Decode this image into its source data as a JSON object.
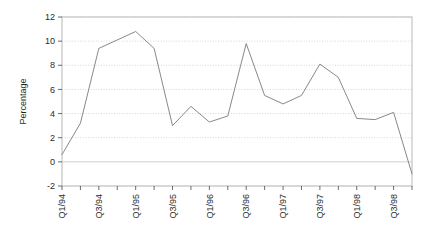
{
  "chart_data": {
    "type": "line",
    "title": "",
    "subtitle": "",
    "xlabel": "",
    "ylabel": "Percentage",
    "ylim": [
      -2,
      12
    ],
    "yticks": [
      -2,
      0,
      2,
      4,
      6,
      8,
      10,
      12
    ],
    "ytick_labels": [
      "-2",
      "0",
      "2",
      "4",
      "6",
      "8",
      "10",
      "12"
    ],
    "grid": true,
    "grid_style": "dotted-horizontal",
    "legend": "none",
    "line_color": "#7a7a7a",
    "frame_color": "#b8b8b8",
    "zero_line_color": "#d0d0d0",
    "background": "#ffffff",
    "x": [
      "Q1/94",
      "Q2/94",
      "Q3/94",
      "Q4/94",
      "Q1/95",
      "Q2/95",
      "Q3/95",
      "Q4/95",
      "Q1/96",
      "Q2/96",
      "Q3/96",
      "Q4/96",
      "Q1/97",
      "Q2/97",
      "Q3/97",
      "Q4/97",
      "Q1/98",
      "Q2/98",
      "Q3/98",
      "Q4/98"
    ],
    "xtick_labels": [
      "Q1/94",
      "",
      "Q3/94",
      "",
      "Q1/95",
      "",
      "Q3/95",
      "",
      "Q1/96",
      "",
      "Q3/96",
      "",
      "Q1/97",
      "",
      "Q3/97",
      "",
      "Q1/98",
      "",
      "Q3/98",
      ""
    ],
    "xtick_rotation": 90,
    "values": [
      0.6,
      3.2,
      9.4,
      10.1,
      10.8,
      9.4,
      3.0,
      4.6,
      3.3,
      3.8,
      9.8,
      5.5,
      4.8,
      5.5,
      8.1,
      7.0,
      3.6,
      3.5,
      4.1,
      -1.0
    ],
    "series": [
      {
        "name": "Percentage",
        "values": [
          0.6,
          3.2,
          9.4,
          10.1,
          10.8,
          9.4,
          3.0,
          4.6,
          3.3,
          3.8,
          9.8,
          5.5,
          4.8,
          5.5,
          8.1,
          7.0,
          3.6,
          3.5,
          4.1,
          -1.0
        ]
      }
    ]
  }
}
